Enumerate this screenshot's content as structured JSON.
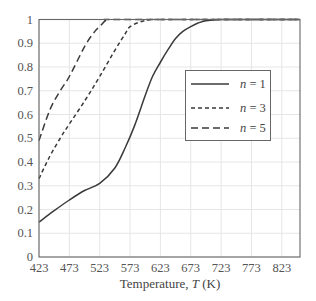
{
  "chart_data": {
    "type": "line",
    "title": "",
    "xlabel": "Temperature, T (K)",
    "xlabel_parts": {
      "prefix": "Temperature, ",
      "italic": "T",
      "suffix": " (K)"
    },
    "ylabel": "",
    "xlim": [
      423,
      853
    ],
    "ylim": [
      0,
      1
    ],
    "grid": true,
    "legend_position": "center-right (inside plot)",
    "x_ticks": [
      423,
      473,
      523,
      573,
      623,
      673,
      723,
      773,
      823
    ],
    "y_ticks": [
      0,
      0.1,
      0.2,
      0.3,
      0.4,
      0.5,
      0.6,
      0.7,
      0.8,
      0.9,
      1
    ],
    "y_tick_labels": [
      "0",
      "0.1",
      "0.2",
      "0.3",
      "0.4",
      "0.5",
      "0.6",
      "0.7",
      "0.8",
      "0.9",
      "1"
    ],
    "series": [
      {
        "name": "n=1",
        "legend_var": "n",
        "legend_value": "1",
        "line_style": "solid",
        "dash": "",
        "x": [
          423,
          448,
          473,
          498,
          523,
          548,
          565,
          580,
          598,
          610,
          623,
          636,
          648,
          660,
          673,
          685,
          698,
          723,
          773,
          823,
          853
        ],
        "y": [
          0.147,
          0.195,
          0.24,
          0.28,
          0.31,
          0.375,
          0.46,
          0.55,
          0.68,
          0.76,
          0.82,
          0.875,
          0.92,
          0.95,
          0.97,
          0.985,
          0.995,
          1.0,
          1.0,
          1.0,
          1.0
        ]
      },
      {
        "name": "n=3",
        "legend_var": "n",
        "legend_value": "3",
        "line_style": "short-dash",
        "dash": "4,3",
        "x": [
          423,
          440,
          458,
          473,
          499,
          523,
          548,
          565,
          573,
          590,
          610,
          640,
          853
        ],
        "y": [
          0.33,
          0.42,
          0.5,
          0.56,
          0.66,
          0.76,
          0.87,
          0.94,
          0.97,
          0.99,
          1.0,
          1.0,
          1.0
        ]
      },
      {
        "name": "n=5",
        "legend_var": "n",
        "legend_value": "5",
        "line_style": "long-dash",
        "dash": "7,4",
        "x": [
          423,
          441,
          458,
          473,
          499,
          515,
          523,
          536,
          560,
          853
        ],
        "y": [
          0.49,
          0.62,
          0.7,
          0.76,
          0.89,
          0.95,
          0.97,
          1.0,
          1.0,
          1.0
        ]
      }
    ]
  },
  "colors": {
    "series": "#3a3a3a",
    "grid": "#e6e6e6",
    "frame": "#666666",
    "text": "#555555"
  }
}
